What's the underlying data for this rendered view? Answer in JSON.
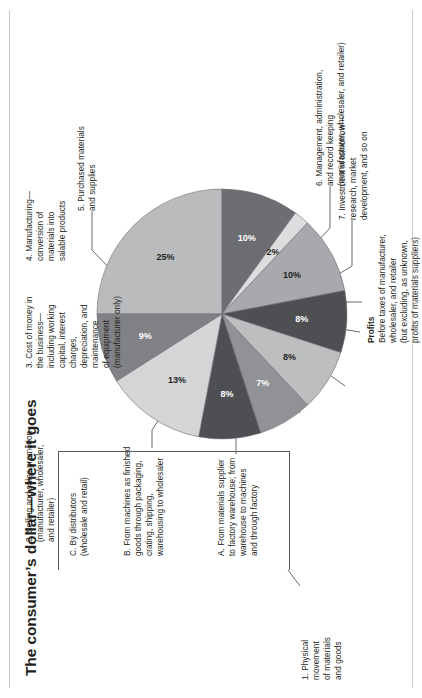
{
  "title": "The consumer’s dollar—where it goes",
  "chart_data": {
    "type": "pie",
    "title": "The consumer’s dollar—where it goes",
    "unit": "percent",
    "legend_position": "callouts",
    "categories": [
      "5. Purchased materials and supplies",
      "6. Management, administration, and record keeping (manufacturer, wholesaler, and retailer)",
      "7. Investment in tomorrow—research, market development, and so on",
      "Profits — Before taxes of manufacturer, wholesaler, and retailer (but excluding, as unknown, profits of materials suppliers)",
      "A. From materials supplier to factory warehouse; from warehouse to machines and through factory",
      "B. From machines as finished goods through packaging, crating, shipping, warehousing to wholesaler",
      "C. By distributors (wholesale and retail)",
      "2. Selling and sales promotion (manufacturer, wholesaler, and retailer)",
      "3. Cost of money in the business—including working capital, interest charges, depreciation, and maintenance of equipment (manufacturer only)",
      "4. Manufacturing—conversion of materials into salable products"
    ],
    "values": [
      25,
      10,
      2,
      10,
      8,
      8,
      7,
      8,
      13,
      9
    ],
    "value_labels": [
      "25%",
      "10%",
      "2%",
      "10%",
      "8%",
      "8%",
      "7%",
      "8%",
      "13%",
      "9%"
    ],
    "colors": [
      "#b9bbbd",
      "#6d6e71",
      "#d9dadb",
      "#a7a9ac",
      "#4d4f53",
      "#bcbec0",
      "#8a8c8e",
      "#e2e3e4",
      "#cfd1d2",
      "#808285"
    ],
    "total": 100
  },
  "pie": {
    "slices": [
      {
        "id": "purchased-materials",
        "pct": 25,
        "label": "25%",
        "color": "#b9bbbd",
        "text": "#231f20"
      },
      {
        "id": "management-admin",
        "pct": 10,
        "label": "10%",
        "color": "#6d6e71",
        "text": "#ffffff"
      },
      {
        "id": "investment",
        "pct": 2,
        "label": "2%",
        "color": "#dcdddf",
        "text": "#231f20"
      },
      {
        "id": "profits",
        "pct": 10,
        "label": "10%",
        "color": "#a7a9ac",
        "text": "#231f20"
      },
      {
        "id": "movement-a",
        "pct": 8,
        "label": "8%",
        "color": "#4d4f53",
        "text": "#ffffff"
      },
      {
        "id": "movement-b",
        "pct": 8,
        "label": "8%",
        "color": "#bcbec0",
        "text": "#231f20"
      },
      {
        "id": "movement-c",
        "pct": 7,
        "label": "7%",
        "color": "#909295",
        "text": "#ffffff"
      },
      {
        "id": "selling-promotion",
        "pct": 8,
        "label": "8%",
        "color": "#4d4f53",
        "text": "#ffffff"
      },
      {
        "id": "cost-of-money",
        "pct": 13,
        "label": "13%",
        "color": "#d3d5d6",
        "text": "#231f20"
      },
      {
        "id": "manufacturing",
        "pct": 9,
        "label": "9%",
        "color": "#808285",
        "text": "#ffffff"
      }
    ]
  },
  "callouts": {
    "purchased_materials": "5. Purchased materials\nand supplies",
    "management": "6. Management, administration,\nand record keeping\n(manufacturer, wholesaler, and retailer)",
    "investment": "7. Investment in tomorrow—\nresearch, market\ndevelopment, and so on",
    "profits_head": "Profits",
    "profits_body": "Before taxes of manufacturer,\nwholesaler, and retailer\n(but excluding, as unknown,\nprofits of materials suppliers)",
    "movement_head": "1. Physical\nmovement\nof materials\nand goods",
    "movement_a": "A. From materials supplier\nto factory warehouse; from\nwarehouse to machines\nand through factory",
    "movement_b": "B. From machines as finished\ngoods through packaging,\ncrating, shipping,\nwarehousing to wholesaler",
    "movement_c": "C. By distributors\n(wholesale and retail)",
    "selling": "2. Selling and sales promotion\n(manufacturer, wholesaler,\nand retailer)",
    "cost_of_money": "3. Cost of money in\nthe business—\nincluding working\ncapital, interest\ncharges,\ndepreciation, and\nmaintenance\nof equipment\n(manufacturer only)",
    "manufacturing": "4. Manufacturing—\nconversion of\nmaterials into\nsalable products"
  }
}
